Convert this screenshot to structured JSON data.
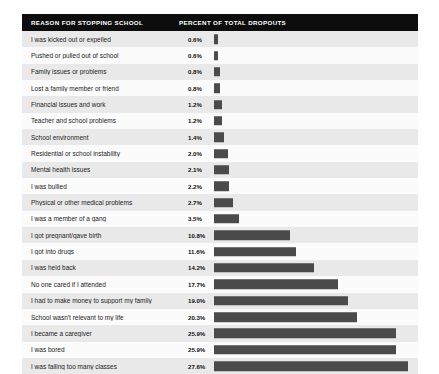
{
  "header": {
    "reason_label": "REASON FOR STOPPING SCHOOL",
    "percent_label": "PERCENT OF TOTAL DROPOUTS"
  },
  "style": {
    "bar_color": "#4b4b4b",
    "header_bg": "#0d0d0d",
    "header_text": "#ffffff",
    "row_stripe_dark": "#e9e9e9",
    "row_stripe_light": "#fbfbfb",
    "panel_bg": "#f2f2f2"
  },
  "chart_data": {
    "type": "bar",
    "orientation": "horizontal",
    "title": "",
    "xlabel": "PERCENT OF TOTAL DROPOUTS",
    "ylabel": "REASON FOR STOPPING SCHOOL",
    "xlim": [
      0,
      27.6
    ],
    "grid": false,
    "legend": false,
    "value_suffix": "%",
    "categories": [
      "I was kicked out or expelled",
      "Pushed or pulled out of school",
      "Family issues or problems",
      "Lost a family member or friend",
      "Financial issues and work",
      "Teacher and school problems",
      "School environment",
      "Residential or school instability",
      "Mental health issues",
      "I was bullied",
      "Physical or other medical problems",
      "I was a member of a gang",
      "I got pregnant/gave birth",
      "I got into drugs",
      "I was held back",
      "No one cared if I attended",
      "I had to make money to support my family",
      "School wasn't relevant to my life",
      "I became a caregiver",
      "I was bored",
      "I was failing too many classes"
    ],
    "values": [
      0.6,
      0.6,
      0.8,
      0.8,
      1.2,
      1.2,
      1.4,
      2.0,
      2.1,
      2.2,
      2.7,
      3.5,
      10.8,
      11.6,
      14.2,
      17.7,
      19.0,
      20.3,
      25.9,
      25.9,
      27.6
    ],
    "value_labels": [
      "0.6%",
      "0.6%",
      "0.8%",
      "0.8%",
      "1.2%",
      "1.2%",
      "1.4%",
      "2.0%",
      "2.1%",
      "2.2%",
      "2.7%",
      "3.5%",
      "10.8%",
      "11.6%",
      "14.2%",
      "17.7%",
      "19.0%",
      "20.3%",
      "25.9%",
      "25.9%",
      "27.6%"
    ]
  }
}
